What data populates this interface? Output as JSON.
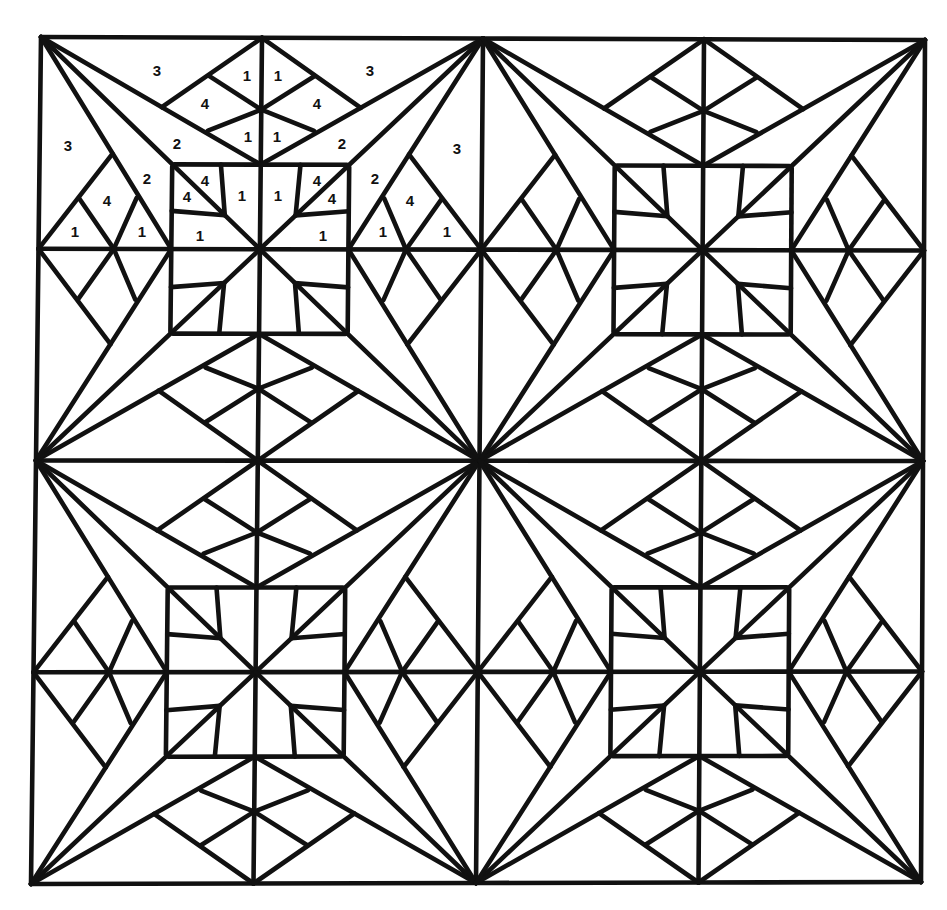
{
  "artwork": {
    "title": "Quilt block color-by-number pattern",
    "background": "#ffffff",
    "ink": "#111111",
    "corners": {
      "tl": [
        41,
        37
      ],
      "tr": [
        925,
        40
      ],
      "bl": [
        31,
        884
      ],
      "br": [
        921,
        882
      ]
    },
    "grid_units": 4,
    "block_size_units": 2,
    "octant_segments": [
      [
        [
          0,
          0
        ],
        [
          1,
          0
        ]
      ],
      [
        [
          1,
          0
        ],
        [
          1,
          1
        ]
      ],
      [
        [
          0,
          0
        ],
        [
          1,
          1
        ]
      ],
      [
        [
          0,
          0
        ],
        [
          1,
          0.6
        ]
      ],
      [
        [
          0.55,
          0.33
        ],
        [
          1,
          0
        ]
      ],
      [
        [
          0.76,
          0.18
        ],
        [
          1,
          0.34
        ]
      ],
      [
        [
          0.76,
          0.44
        ],
        [
          1,
          0.34
        ]
      ],
      [
        [
          0.61,
          0.6
        ],
        [
          1,
          0.6
        ]
      ],
      [
        [
          0.82,
          0.6
        ],
        [
          0.84,
          0.84
        ]
      ]
    ]
  },
  "labels": [
    {
      "text": "3",
      "x": 157,
      "y": 72
    },
    {
      "text": "1",
      "x": 247,
      "y": 77
    },
    {
      "text": "1",
      "x": 278,
      "y": 77
    },
    {
      "text": "3",
      "x": 370,
      "y": 72
    },
    {
      "text": "4",
      "x": 205,
      "y": 105
    },
    {
      "text": "4",
      "x": 317,
      "y": 105
    },
    {
      "text": "1",
      "x": 248,
      "y": 138
    },
    {
      "text": "1",
      "x": 277,
      "y": 138
    },
    {
      "text": "3",
      "x": 68,
      "y": 147
    },
    {
      "text": "2",
      "x": 177,
      "y": 145
    },
    {
      "text": "2",
      "x": 342,
      "y": 145
    },
    {
      "text": "3",
      "x": 457,
      "y": 150
    },
    {
      "text": "2",
      "x": 147,
      "y": 180
    },
    {
      "text": "4",
      "x": 205,
      "y": 182
    },
    {
      "text": "4",
      "x": 317,
      "y": 182
    },
    {
      "text": "2",
      "x": 375,
      "y": 180
    },
    {
      "text": "4",
      "x": 107,
      "y": 202
    },
    {
      "text": "4",
      "x": 187,
      "y": 198
    },
    {
      "text": "1",
      "x": 242,
      "y": 197
    },
    {
      "text": "1",
      "x": 278,
      "y": 197
    },
    {
      "text": "4",
      "x": 332,
      "y": 200
    },
    {
      "text": "4",
      "x": 410,
      "y": 202
    },
    {
      "text": "1",
      "x": 75,
      "y": 233
    },
    {
      "text": "1",
      "x": 142,
      "y": 233
    },
    {
      "text": "1",
      "x": 200,
      "y": 237
    },
    {
      "text": "1",
      "x": 323,
      "y": 237
    },
    {
      "text": "1",
      "x": 383,
      "y": 233
    },
    {
      "text": "1",
      "x": 447,
      "y": 233
    }
  ]
}
